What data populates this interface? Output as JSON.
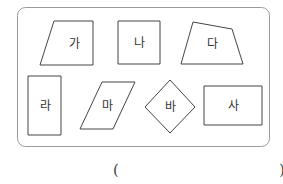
{
  "problem": {
    "frame": {
      "x": 17,
      "y": 7,
      "width": 253,
      "height": 140,
      "radius": 8,
      "stroke": "#9a9a9a"
    },
    "shapes": [
      {
        "label": "가",
        "type": "trapezoid",
        "points": "54,21 93,21 93,65 40,65",
        "label_pos": [
          74,
          44
        ]
      },
      {
        "label": "나",
        "type": "square",
        "points": "118,21 160,21 160,64 118,64",
        "label_pos": [
          139,
          43
        ]
      },
      {
        "label": "다",
        "type": "quadrilateral",
        "points": "193,22 232,29 243,64 181,64",
        "label_pos": [
          212,
          44
        ]
      },
      {
        "label": "라",
        "type": "rectangle",
        "points": "28,76 61,76 61,135 28,135",
        "label_pos": [
          45,
          106
        ]
      },
      {
        "label": "마",
        "type": "parallelogram",
        "points": "102,82 135,82 113,129 80,129",
        "label_pos": [
          107,
          106
        ]
      },
      {
        "label": "바",
        "type": "rhombus",
        "points": "170,80 195,107 170,133 145,107",
        "label_pos": [
          170,
          107
        ]
      },
      {
        "label": "사",
        "type": "rectangle",
        "points": "204,86 262,86 262,125 204,125",
        "label_pos": [
          233,
          106
        ]
      }
    ],
    "shape_stroke": "#444444",
    "answer": {
      "open_bracket": "(",
      "close_bracket": ")",
      "value": ""
    }
  }
}
